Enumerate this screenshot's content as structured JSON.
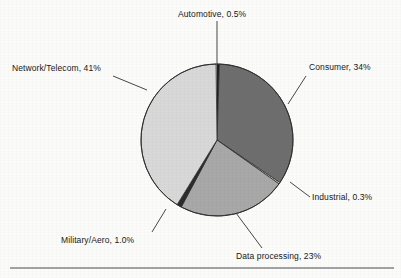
{
  "figure": {
    "background_color": "#fbfbfa",
    "text_color": "#171717",
    "rule_color": "#4a4a4a"
  },
  "chart_data": {
    "type": "pie",
    "title": "",
    "subtitle": "",
    "xlabel": "",
    "ylabel": "",
    "legend_position": "none",
    "grid": false,
    "label_format": "{name}, {value}%",
    "start_angle_deg": 0,
    "direction": "clockwise",
    "center": {
      "x": 217,
      "y": 140
    },
    "radius": 76,
    "categories": [
      "Automotive",
      "Consumer",
      "Industrial",
      "Data processing",
      "Military/Aero",
      "Network/Telecom"
    ],
    "values": [
      0.5,
      34,
      0.3,
      23,
      1.0,
      41
    ],
    "value_texts": [
      "0.5%",
      "34%",
      "0.3%",
      "23%",
      "1.0%",
      "41%"
    ],
    "colors": [
      "#1a1a1a",
      "#6e6e6e",
      "#f4f4f2",
      "#a8a8a8",
      "#2b2b2b",
      "#d8d8d8"
    ],
    "slices": [
      {
        "name": "Automotive",
        "value": 0.5,
        "value_text": "0.5%",
        "label": "Automotive, 0.5%",
        "color": "#1a1a1a",
        "start_angle_deg": 0,
        "end_angle_deg": 1.8
      },
      {
        "name": "Consumer",
        "value": 34,
        "value_text": "34%",
        "label": "Consumer, 34%",
        "color": "#6e6e6e",
        "start_angle_deg": 1.8,
        "end_angle_deg": 124.2
      },
      {
        "name": "Industrial",
        "value": 0.3,
        "value_text": "0.3%",
        "label": "Industrial, 0.3%",
        "color": "#f4f4f2",
        "start_angle_deg": 124.2,
        "end_angle_deg": 125.28
      },
      {
        "name": "Data processing",
        "value": 23,
        "value_text": "23%",
        "label": "Data processing, 23%",
        "color": "#a8a8a8",
        "start_angle_deg": 125.28,
        "end_angle_deg": 208.08
      },
      {
        "name": "Military/Aero",
        "value": 1.0,
        "value_text": "1.0%",
        "label": "Military/Aero, 1.0%",
        "color": "#2b2b2b",
        "start_angle_deg": 208.08,
        "end_angle_deg": 211.68
      },
      {
        "name": "Network/Telecom",
        "value": 41,
        "value_text": "41%",
        "label": "Network/Telecom, 41%",
        "color": "#d8d8d8",
        "start_angle_deg": 211.68,
        "end_angle_deg": 359.28
      }
    ]
  },
  "labels": {
    "automotive": "Automotive, 0.5%",
    "consumer": "Consumer, 34%",
    "industrial": "Industrial, 0.3%",
    "data_processing": "Data processing, 23%",
    "military_aero": "Military/Aero, 1.0%",
    "network_telecom": "Network/Telecom, 41%"
  }
}
